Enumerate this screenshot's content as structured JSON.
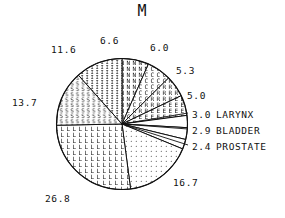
{
  "chart_data": {
    "type": "pie",
    "title": "M",
    "xlabel": "",
    "ylabel": "",
    "legend_position": "right",
    "grid": false,
    "units": "percent",
    "total": 100.0,
    "categories": [
      "6.6",
      "6.0",
      "5.3",
      "5.0",
      "3.0 LARYNX",
      "2.9 BLADDER",
      "2.4 PROSTATE",
      "16.7",
      "26.8",
      "13.7",
      "11.6"
    ],
    "values": [
      6.6,
      6.0,
      5.3,
      5.0,
      3.0,
      2.9,
      2.4,
      16.7,
      26.8,
      13.7,
      11.6
    ],
    "slices": [
      {
        "label": "6.6",
        "value": 6.6,
        "fill": "char-N",
        "name": ""
      },
      {
        "label": "6.0",
        "value": 6.0,
        "fill": "char-C",
        "name": ""
      },
      {
        "label": "5.3",
        "value": 5.3,
        "fill": "char-R",
        "name": ""
      },
      {
        "label": "5.0",
        "value": 5.0,
        "fill": "char-E",
        "name": ""
      },
      {
        "label": "3.0",
        "value": 3.0,
        "fill": "blank",
        "name": "LARYNX"
      },
      {
        "label": "2.9",
        "value": 2.9,
        "fill": "blank",
        "name": "BLADDER"
      },
      {
        "label": "2.4",
        "value": 2.4,
        "fill": "blank",
        "name": "PROSTATE"
      },
      {
        "label": "16.7",
        "value": 16.7,
        "fill": "dots",
        "name": ""
      },
      {
        "label": "26.8",
        "value": 26.8,
        "fill": "char-L",
        "name": ""
      },
      {
        "label": "13.7",
        "value": 13.7,
        "fill": "char-S",
        "name": ""
      },
      {
        "label": "11.6",
        "value": 11.6,
        "fill": "char-I",
        "name": ""
      }
    ]
  },
  "title": "M",
  "labels": {
    "top_center": "6.6",
    "top_right": "6.0",
    "upper_left": "11.6",
    "right_upper": "5.3",
    "right_mid": "5.0",
    "left": "13.7",
    "bottom_left": "26.8",
    "bottom_right": "16.7"
  },
  "legend": {
    "rows": [
      {
        "value": "3.0",
        "name": "LARYNX"
      },
      {
        "value": "2.9",
        "name": "BLADDER"
      },
      {
        "value": "2.4",
        "name": "PROSTATE"
      }
    ]
  },
  "colors": {
    "ink": "#111111",
    "background": "#ffffff"
  }
}
